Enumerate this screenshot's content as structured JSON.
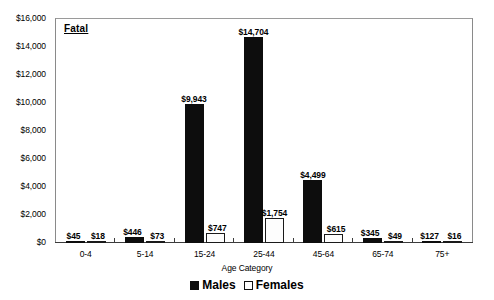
{
  "chart_data": {
    "type": "bar",
    "title": "Fatal",
    "xlabel": "Age Category",
    "ylabel": "",
    "categories": [
      "0-4",
      "5-14",
      "15-24",
      "25-44",
      "45-64",
      "65-74",
      "75+"
    ],
    "series": [
      {
        "name": "Males",
        "values": [
          45,
          446,
          9943,
          14704,
          4499,
          345,
          127
        ],
        "labels": [
          "$45",
          "$446",
          "$9,943",
          "$14,704",
          "$4,499",
          "$345",
          "$127"
        ]
      },
      {
        "name": "Females",
        "values": [
          18,
          73,
          747,
          1754,
          615,
          49,
          16
        ],
        "labels": [
          "$18",
          "$73",
          "$747",
          "$1,754",
          "$615",
          "$49",
          "$16"
        ]
      }
    ],
    "ylim": [
      0,
      16000
    ],
    "ytick_values": [
      0,
      2000,
      4000,
      6000,
      8000,
      10000,
      12000,
      14000,
      16000
    ],
    "ytick_labels": [
      "$0",
      "$2,000",
      "$4,000",
      "$6,000",
      "$8,000",
      "$10,000",
      "$12,000",
      "$14,000",
      "$16,000"
    ],
    "grid": false,
    "legend_position": "bottom",
    "colors": {
      "males": "#0d0d0d",
      "females": "#ffffff",
      "border": "#1a1a1a",
      "frame": "#8a8a8a",
      "background": "#ffffff"
    }
  },
  "legend": {
    "items": [
      {
        "label": "Males",
        "swatch": "filled-square"
      },
      {
        "label": "Females",
        "swatch": "open-square"
      }
    ]
  },
  "axis": {
    "x_title": "Age Category"
  },
  "panel": {
    "label": "Fatal"
  }
}
